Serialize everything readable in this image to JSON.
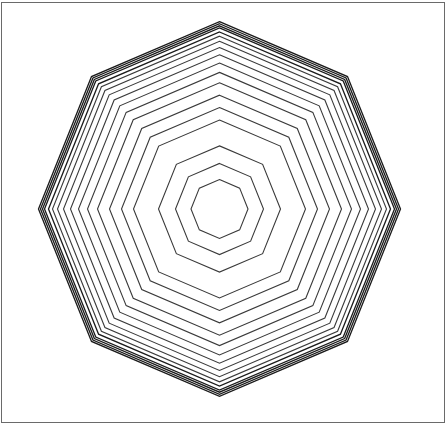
{
  "figure": {
    "shape": "octagon",
    "sides": 8,
    "orientation": "vertex-up",
    "center": [
      219.5,
      209
    ],
    "vertical_scale": 1.035,
    "stroke_color": "#3a3a3a",
    "outer_stroke_color": "#1a1a1a",
    "background": "#ffffff",
    "frame_border_color": "#6a6a6a",
    "radii": [
      28.5,
      44,
      61,
      86,
      98,
      110,
      122,
      132,
      141,
      149,
      156,
      162,
      167,
      171,
      175,
      177,
      179,
      181
    ]
  }
}
